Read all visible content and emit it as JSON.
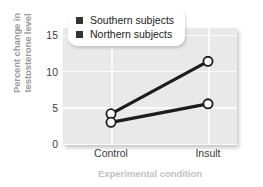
{
  "chart_data": {
    "type": "line",
    "title": "",
    "xlabel": "Experimental condition",
    "ylabel": "Percent change in testosterone level",
    "categories": [
      "Control",
      "Insult"
    ],
    "ylim": [
      0,
      16.5
    ],
    "yticks": [
      0,
      5,
      10,
      15
    ],
    "ytick_labels": [
      "0",
      "5",
      "10",
      "15"
    ],
    "grid": true,
    "legend_position": "top-center",
    "series": [
      {
        "name": "Southern subjects",
        "values": [
          4.4,
          11.8
        ],
        "marker": "open-circle",
        "color": "#1c1c1c"
      },
      {
        "name": "Northern subjects",
        "values": [
          3.2,
          5.8
        ],
        "marker": "open-circle",
        "color": "#1c1c1c"
      }
    ],
    "colors": {
      "plot_background": "#e9e9e9",
      "gridline": "#fafafa",
      "line": "#1c1c1c",
      "marker_fill": "#ffffff",
      "axis_title": "#9b9b9b",
      "xaxis_title": "#c2c2c2",
      "tick_label": "#3a3a3a",
      "legend_swatch": "#333333"
    }
  },
  "yaxis": {
    "title_line1": "Percent change in",
    "title_line2": "testosterone level",
    "ticks": [
      "15",
      "10",
      "5",
      "0"
    ]
  },
  "xaxis": {
    "title": "Experimental condition",
    "ticks": [
      "Control",
      "Insult"
    ]
  },
  "legend": {
    "items": [
      {
        "label": "Southern subjects"
      },
      {
        "label": "Northern subjects"
      }
    ]
  }
}
